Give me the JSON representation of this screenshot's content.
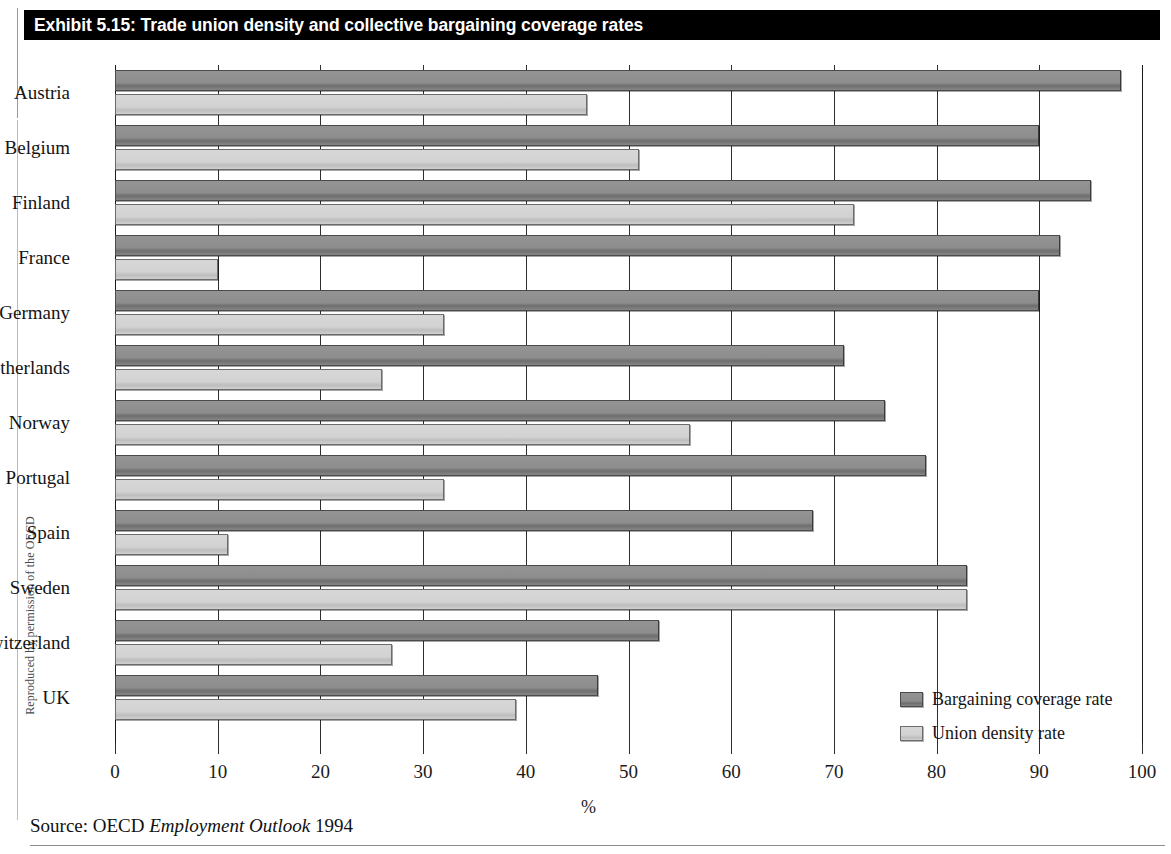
{
  "page": {
    "credit": "Reproduced by permission of the OECD",
    "source_prefix": "Source: OECD",
    "source_italic": "Employment Outlook",
    "source_year": "1994"
  },
  "title": {
    "text": "Exhibit 5.15: Trade union density and collective bargaining coverage rates"
  },
  "legend": {
    "position": "inside-bottom-right",
    "items": [
      {
        "label": "Bargaining coverage rate",
        "color": "#8d8d8d",
        "key": "coverage"
      },
      {
        "label": "Union density rate",
        "color": "#d2d2d2",
        "key": "density"
      }
    ]
  },
  "chart_data": {
    "type": "bar",
    "orientation": "horizontal",
    "title": "Exhibit 5.15: Trade union density and collective bargaining coverage rates",
    "xlabel": "%",
    "ylabel": "",
    "xlim": [
      0,
      100
    ],
    "xticks": [
      0,
      10,
      20,
      30,
      40,
      50,
      60,
      70,
      80,
      90,
      100
    ],
    "xtick_labels": [
      "0",
      "10",
      "20",
      "30",
      "40",
      "50",
      "60",
      "70",
      "80",
      "90",
      "100"
    ],
    "grid": true,
    "grid_axis": "x",
    "legend_position": "inside-bottom-right",
    "categories": [
      "Austria",
      "Belgium",
      "Finland",
      "France",
      "Germany",
      "Netherlands",
      "Norway",
      "Portugal",
      "Spain",
      "Sweden",
      "Switzerland",
      "UK"
    ],
    "series": [
      {
        "name": "Bargaining coverage rate",
        "color": "#8d8d8d",
        "values": [
          98,
          90,
          95,
          92,
          90,
          71,
          75,
          79,
          68,
          83,
          53,
          47
        ]
      },
      {
        "name": "Union density rate",
        "color": "#d2d2d2",
        "values": [
          46,
          51,
          72,
          10,
          32,
          26,
          56,
          32,
          11,
          83,
          27,
          39
        ]
      }
    ]
  }
}
